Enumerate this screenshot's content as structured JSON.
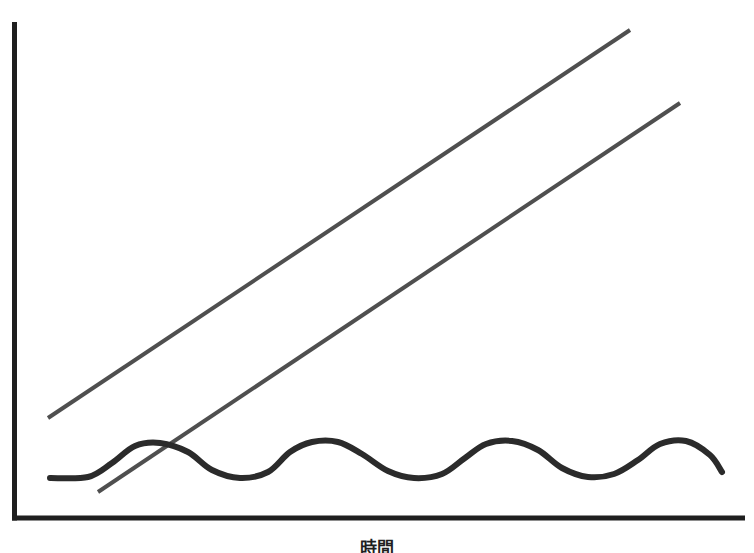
{
  "chart_data": {
    "type": "line",
    "title": "",
    "subtitle": "",
    "xlabel": "時間",
    "ylabel": "",
    "grid": false,
    "legend": "none",
    "axis_color": "#1f1f1f",
    "xlim": [
      0,
      754
    ],
    "ylim": [
      0,
      553
    ],
    "annotations": [],
    "series": [
      {
        "name": "upper-trend",
        "type": "line",
        "color": "#4f4f4f",
        "stroke_width": 4,
        "shape": "straight-rising",
        "points": [
          [
            48,
            418
          ],
          [
            630,
            30
          ]
        ]
      },
      {
        "name": "lower-trend",
        "type": "line",
        "color": "#4f4f4f",
        "stroke_width": 4,
        "shape": "straight-rising",
        "points": [
          [
            98,
            492
          ],
          [
            680,
            103
          ]
        ]
      },
      {
        "name": "oscillating-wave",
        "type": "line",
        "color": "#2b2b2b",
        "stroke_width": 6,
        "shape": "sinusoidal-flat",
        "points": [
          [
            50,
            478
          ],
          [
            88,
            477
          ],
          [
            112,
            463
          ],
          [
            135,
            446
          ],
          [
            160,
            443
          ],
          [
            188,
            452
          ],
          [
            212,
            470
          ],
          [
            240,
            478
          ],
          [
            268,
            472
          ],
          [
            290,
            452
          ],
          [
            312,
            442
          ],
          [
            338,
            442
          ],
          [
            362,
            454
          ],
          [
            388,
            471
          ],
          [
            414,
            478
          ],
          [
            442,
            474
          ],
          [
            465,
            458
          ],
          [
            486,
            444
          ],
          [
            512,
            441
          ],
          [
            538,
            450
          ],
          [
            562,
            468
          ],
          [
            588,
            477
          ],
          [
            614,
            474
          ],
          [
            638,
            460
          ],
          [
            660,
            444
          ],
          [
            686,
            441
          ],
          [
            710,
            455
          ],
          [
            722,
            472
          ]
        ]
      }
    ],
    "axes": {
      "y_axis": {
        "x": 13,
        "y_top": 22,
        "y_bottom": 520
      },
      "x_axis": {
        "y": 518,
        "x_left": 13,
        "x_right": 745
      }
    }
  }
}
